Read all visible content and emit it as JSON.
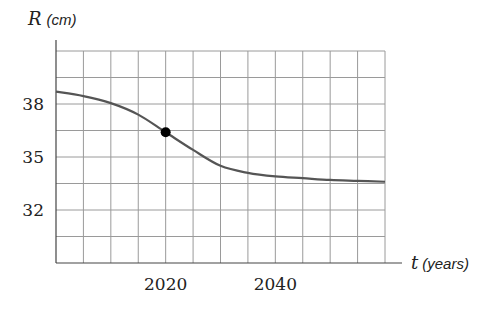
{
  "chart_data": {
    "type": "line",
    "title": "",
    "xlabel": {
      "var": "t",
      "unit": "(years)"
    },
    "ylabel": {
      "var": "R",
      "unit": "(cm)"
    },
    "xlim": [
      2000,
      2060
    ],
    "ylim": [
      29,
      41
    ],
    "x_grid_step": 5,
    "y_grid_step": 1.5,
    "grid": true,
    "x_ticks": [
      {
        "value": 2020,
        "label": "2020"
      },
      {
        "value": 2040,
        "label": "2040"
      }
    ],
    "y_ticks": [
      {
        "value": 38,
        "label": "38"
      },
      {
        "value": 35,
        "label": "35"
      },
      {
        "value": 32,
        "label": "32"
      }
    ],
    "series": [
      {
        "name": "R(t)",
        "color": "#555555",
        "x": [
          2000,
          2005,
          2010,
          2015,
          2020,
          2025,
          2030,
          2035,
          2040,
          2045,
          2050,
          2055,
          2060
        ],
        "values": [
          38.7,
          38.45,
          38.05,
          37.4,
          36.4,
          35.4,
          34.5,
          34.1,
          33.9,
          33.8,
          33.7,
          33.65,
          33.6
        ]
      }
    ],
    "highlighted_points": [
      {
        "x": 2020,
        "y": 36.4,
        "color": "#000000"
      }
    ]
  }
}
